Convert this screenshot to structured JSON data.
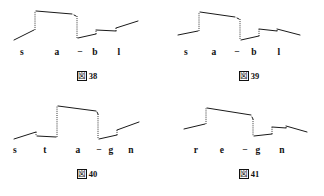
{
  "page": {
    "background_color": "#ffffff",
    "ink_color": "#1a1a1a"
  },
  "figures": [
    {
      "id": "figure-38",
      "caption_mark": "図",
      "caption_number": "38",
      "caption_full": "図 38",
      "phonemes": [
        {
          "label": "s",
          "x": 22
        },
        {
          "label": "a",
          "x": 57
        },
        {
          "label": "−",
          "x": 80
        },
        {
          "label": "b",
          "x": 95
        },
        {
          "label": "l",
          "x": 119
        }
      ],
      "contour": {
        "type": "step-contour",
        "solid_segments": [
          [
            [
              14,
              40
            ],
            [
              34,
              30
            ]
          ],
          [
            [
              36,
              11
            ],
            [
              72,
              14
            ]
          ],
          [
            [
              74,
              15
            ],
            [
              76,
              16
            ]
          ],
          [
            [
              78,
              38
            ],
            [
              96,
              34
            ]
          ],
          [
            [
              96,
              30
            ],
            [
              116,
              31
            ]
          ],
          [
            [
              116,
              28
            ],
            [
              138,
              21
            ]
          ]
        ],
        "dotted_segments": [
          [
            [
              35,
              30
            ],
            [
              35,
              11
            ]
          ],
          [
            [
              77,
              16
            ],
            [
              77,
              38
            ]
          ],
          [
            [
              96,
              34
            ],
            [
              96,
              30
            ]
          ],
          [
            [
              116,
              31
            ],
            [
              116,
              28
            ]
          ]
        ]
      }
    },
    {
      "id": "figure-39",
      "caption_mark": "図",
      "caption_number": "39",
      "caption_full": "図 39",
      "phonemes": [
        {
          "label": "s",
          "x": 24
        },
        {
          "label": "a",
          "x": 52
        },
        {
          "label": "−",
          "x": 75
        },
        {
          "label": "b",
          "x": 92
        },
        {
          "label": "l",
          "x": 117
        }
      ],
      "contour": {
        "type": "step-contour",
        "solid_segments": [
          [
            [
              16,
              35
            ],
            [
              36,
              31
            ]
          ],
          [
            [
              38,
              12
            ],
            [
              73,
              17
            ]
          ],
          [
            [
              75,
              18
            ],
            [
              77,
              19
            ]
          ],
          [
            [
              79,
              40
            ],
            [
              97,
              36
            ]
          ],
          [
            [
              97,
              29
            ],
            [
              115,
              31
            ]
          ],
          [
            [
              115,
              29
            ],
            [
              138,
              35
            ]
          ]
        ],
        "dotted_segments": [
          [
            [
              37,
              31
            ],
            [
              37,
              12
            ]
          ],
          [
            [
              78,
              19
            ],
            [
              78,
              40
            ]
          ],
          [
            [
              97,
              36
            ],
            [
              97,
              29
            ]
          ],
          [
            [
              115,
              31
            ],
            [
              115,
              29
            ]
          ]
        ]
      }
    },
    {
      "id": "figure-40",
      "caption_mark": "図",
      "caption_number": "40",
      "caption_full": "図 40",
      "phonemes": [
        {
          "label": "s",
          "x": 15
        },
        {
          "label": "t",
          "x": 45
        },
        {
          "label": "a",
          "x": 78
        },
        {
          "label": "−",
          "x": 99
        },
        {
          "label": "g",
          "x": 111
        },
        {
          "label": "n",
          "x": 131
        }
      ],
      "contour": {
        "type": "step-contour",
        "solid_segments": [
          [
            [
              14,
              41
            ],
            [
              36,
              34
            ]
          ],
          [
            [
              37,
              38
            ],
            [
              56,
              39
            ]
          ],
          [
            [
              58,
              8
            ],
            [
              96,
              13
            ]
          ],
          [
            [
              97,
              14
            ],
            [
              98,
              16
            ]
          ],
          [
            [
              99,
              41
            ],
            [
              117,
              37
            ]
          ],
          [
            [
              117,
              32
            ],
            [
              139,
              24
            ]
          ]
        ],
        "dotted_segments": [
          [
            [
              36,
              34
            ],
            [
              36,
              38
            ]
          ],
          [
            [
              57,
              39
            ],
            [
              57,
              8
            ]
          ],
          [
            [
              98,
              16
            ],
            [
              98,
              41
            ]
          ],
          [
            [
              117,
              37
            ],
            [
              117,
              32
            ]
          ]
        ]
      }
    },
    {
      "id": "figure-41",
      "caption_mark": "図",
      "caption_number": "41",
      "caption_full": "図 41",
      "phonemes": [
        {
          "label": "r",
          "x": 34
        },
        {
          "label": "e",
          "x": 60
        },
        {
          "label": "−",
          "x": 83
        },
        {
          "label": "g",
          "x": 96
        },
        {
          "label": "n",
          "x": 120
        }
      ],
      "contour": {
        "type": "step-contour",
        "solid_segments": [
          [
            [
              22,
              31
            ],
            [
              43,
              26
            ]
          ],
          [
            [
              45,
              10
            ],
            [
              89,
              17
            ]
          ],
          [
            [
              90,
              19
            ],
            [
              91,
              21
            ]
          ],
          [
            [
              92,
              38
            ],
            [
              110,
              36
            ]
          ],
          [
            [
              110,
              29
            ],
            [
              124,
              30
            ]
          ],
          [
            [
              124,
              28
            ],
            [
              145,
              34
            ]
          ]
        ],
        "dotted_segments": [
          [
            [
              44,
              26
            ],
            [
              44,
              10
            ]
          ],
          [
            [
              91,
              21
            ],
            [
              91,
              38
            ]
          ],
          [
            [
              110,
              36
            ],
            [
              110,
              29
            ]
          ],
          [
            [
              124,
              30
            ],
            [
              124,
              28
            ]
          ]
        ]
      }
    }
  ]
}
